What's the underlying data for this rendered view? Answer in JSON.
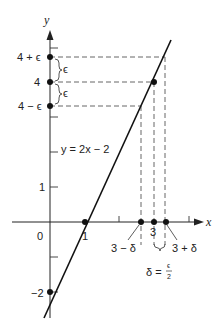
{
  "diagram": {
    "title": "",
    "equation_label": "y = 2x − 2",
    "axes": {
      "x_label": "x",
      "y_label": "y",
      "origin_label": "0"
    },
    "y_tick_labels": {
      "one": "1",
      "neg_two": "−2",
      "four": "4",
      "four_plus_eps": "4 + ϵ",
      "four_minus_eps": "4 − ϵ"
    },
    "x_tick_labels": {
      "one": "1",
      "three": "3",
      "three_minus_delta": "3 − δ",
      "three_plus_delta": "3 + δ"
    },
    "brace_labels": {
      "eps_upper": "ϵ",
      "eps_lower": "ϵ",
      "delta_eq": "δ = ",
      "delta_frac_num": "ϵ",
      "delta_frac_den": "2"
    },
    "points": [
      {
        "name": "x-intercept",
        "x": 1,
        "y": 0
      },
      {
        "name": "y-intercept",
        "x": 0,
        "y": -2
      },
      {
        "name": "target",
        "x": 3,
        "y": 4
      },
      {
        "name": "y-4-plus-eps",
        "x": 0,
        "y": "4+ϵ"
      },
      {
        "name": "y-4",
        "x": 0,
        "y": 4
      },
      {
        "name": "y-4-minus-eps",
        "x": 0,
        "y": "4−ϵ"
      },
      {
        "name": "x-3-minus-delta",
        "x": "3−δ",
        "y": 0
      },
      {
        "name": "x-3",
        "x": 3,
        "y": 0
      },
      {
        "name": "x-3-plus-delta",
        "x": "3+δ",
        "y": 0
      }
    ],
    "colors": {
      "line": "#111111",
      "dashes": "#555555",
      "background": "#ffffff"
    }
  }
}
